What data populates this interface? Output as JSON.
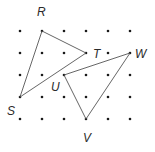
{
  "diagram": {
    "grid": {
      "cols": 6,
      "rows": 5,
      "x0": 20,
      "y0": 31,
      "spacing": 22,
      "dot_color": "#1a1a1a"
    },
    "points": {
      "R": {
        "label": "R",
        "col": 1,
        "row": 0
      },
      "T": {
        "label": "T",
        "col": 3,
        "row": 1
      },
      "S": {
        "label": "S",
        "col": 0,
        "row": 3
      },
      "U": {
        "label": "U",
        "col": 2,
        "row": 2
      },
      "W": {
        "label": "W",
        "col": 5,
        "row": 1
      },
      "V": {
        "label": "V",
        "col": 3,
        "row": 4
      }
    },
    "triangles": [
      {
        "name": "RST",
        "vertices": [
          "R",
          "T",
          "S"
        ]
      },
      {
        "name": "UVW",
        "vertices": [
          "U",
          "W",
          "V"
        ]
      }
    ],
    "line_color": "#555555"
  }
}
